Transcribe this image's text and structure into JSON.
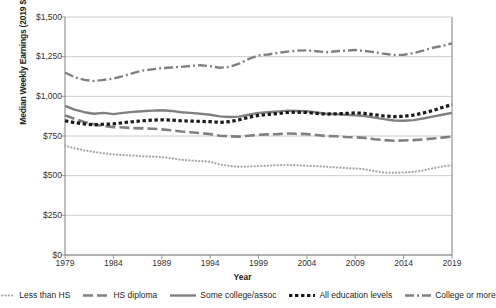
{
  "chart_data": {
    "type": "line",
    "title": "",
    "xlabel": "Year",
    "ylabel": "Median Weekly Earnings (2019 $)",
    "xlim": [
      1979,
      2019
    ],
    "ylim": [
      0,
      1500
    ],
    "ytick_values": [
      0,
      250,
      500,
      750,
      1000,
      1250,
      1500
    ],
    "ytick_labels": [
      "$0",
      "$250",
      "$500",
      "$750",
      "$1,000",
      "$1,250",
      "$1,500"
    ],
    "xtick_values": [
      1979,
      1984,
      1989,
      1994,
      1999,
      2004,
      2009,
      2014,
      2019
    ],
    "xtick_labels": [
      "1979",
      "1984",
      "1989",
      "1994",
      "1999",
      "2004",
      "2009",
      "2014",
      "2019"
    ],
    "grid": "horizontal",
    "legend_position": "bottom",
    "x": [
      1979,
      1980,
      1981,
      1982,
      1983,
      1984,
      1985,
      1986,
      1987,
      1988,
      1989,
      1990,
      1991,
      1992,
      1993,
      1994,
      1995,
      1996,
      1997,
      1998,
      1999,
      2000,
      2001,
      2002,
      2003,
      2004,
      2005,
      2006,
      2007,
      2008,
      2009,
      2010,
      2011,
      2012,
      2013,
      2014,
      2015,
      2016,
      2017,
      2018,
      2019
    ],
    "series": [
      {
        "name": "Less than HS",
        "style": "dotted",
        "color": "#a6a6a6",
        "values": [
          690,
          672,
          660,
          650,
          641,
          634,
          630,
          626,
          622,
          620,
          616,
          610,
          600,
          596,
          592,
          588,
          570,
          562,
          556,
          558,
          560,
          563,
          566,
          568,
          565,
          562,
          560,
          556,
          552,
          548,
          545,
          540,
          528,
          520,
          518,
          520,
          524,
          532,
          546,
          558,
          566
        ]
      },
      {
        "name": "HS diploma",
        "style": "long-dash",
        "color": "#808080",
        "values": [
          880,
          858,
          838,
          824,
          812,
          806,
          804,
          800,
          798,
          796,
          792,
          786,
          778,
          774,
          768,
          762,
          752,
          748,
          746,
          752,
          758,
          760,
          762,
          766,
          764,
          762,
          756,
          750,
          748,
          744,
          742,
          738,
          730,
          724,
          720,
          722,
          724,
          728,
          734,
          740,
          746
        ]
      },
      {
        "name": "Some college/assoc",
        "style": "solid",
        "color": "#808080",
        "values": [
          940,
          916,
          900,
          890,
          896,
          888,
          896,
          902,
          906,
          910,
          912,
          908,
          900,
          896,
          890,
          884,
          874,
          870,
          872,
          884,
          896,
          900,
          904,
          910,
          908,
          906,
          898,
          890,
          888,
          884,
          880,
          876,
          866,
          856,
          848,
          846,
          850,
          860,
          872,
          884,
          896
        ]
      },
      {
        "name": "All education levels",
        "style": "square-dot",
        "color": "#1a1a1a",
        "values": [
          846,
          834,
          826,
          820,
          824,
          826,
          834,
          840,
          846,
          850,
          852,
          850,
          846,
          844,
          842,
          840,
          836,
          840,
          852,
          868,
          880,
          886,
          892,
          898,
          900,
          898,
          892,
          888,
          890,
          892,
          896,
          892,
          884,
          876,
          872,
          874,
          882,
          894,
          910,
          930,
          948
        ]
      },
      {
        "name": "College or more",
        "style": "dash-dot",
        "color": "#808080",
        "values": [
          1150,
          1120,
          1104,
          1096,
          1104,
          1112,
          1128,
          1146,
          1162,
          1170,
          1178,
          1182,
          1186,
          1192,
          1196,
          1190,
          1180,
          1186,
          1206,
          1236,
          1258,
          1264,
          1274,
          1282,
          1288,
          1290,
          1284,
          1278,
          1284,
          1288,
          1292,
          1286,
          1278,
          1268,
          1260,
          1262,
          1272,
          1288,
          1306,
          1318,
          1334
        ]
      }
    ]
  },
  "legend": {
    "items": [
      {
        "label": "Less than HS"
      },
      {
        "label": "HS diploma"
      },
      {
        "label": "Some college/assoc"
      },
      {
        "label": "All education levels"
      },
      {
        "label": "College or more"
      }
    ]
  }
}
